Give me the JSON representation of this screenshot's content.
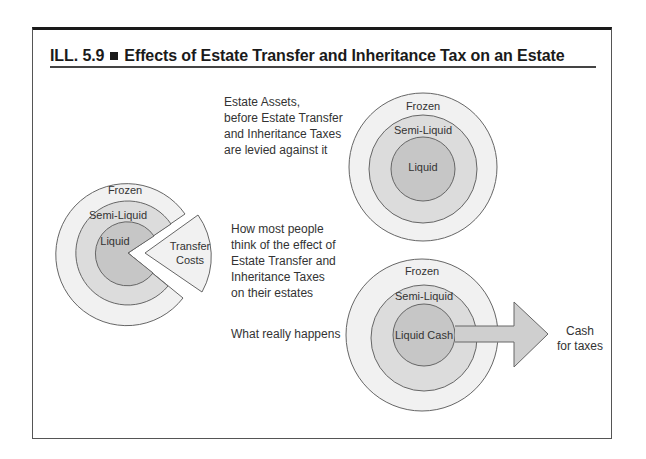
{
  "figure": {
    "label": "ILL. 5.9",
    "title": "Effects of Estate Transfer and Inheritance Tax on an Estate"
  },
  "captions": {
    "before": [
      "Estate Assets,",
      "before Estate Transfer",
      "and Inheritance Taxes",
      "are levied against it"
    ],
    "perceived": [
      "How most people",
      "think of the effect of",
      "Estate Transfer and",
      "Inheritance Taxes",
      "on their estates"
    ],
    "actual": [
      "What really happens"
    ]
  },
  "diagrams": {
    "before": {
      "outer": "Frozen",
      "middle": "Semi-Liquid",
      "inner": "Liquid"
    },
    "perceived": {
      "outer": "Frozen",
      "middle": "Semi-Liquid",
      "inner": "Liquid",
      "wedge": [
        "Transfer",
        "Costs"
      ]
    },
    "actual": {
      "outer": "Frozen",
      "middle": "Semi-Liquid",
      "inner": "Liquid Cash",
      "arrow_label": [
        "Cash",
        "for taxes"
      ]
    }
  },
  "colors": {
    "outer_fill": "#f1f1f1",
    "middle_fill": "#dcdcdc",
    "inner_fill": "#c6c6c6",
    "stroke": "#666666"
  }
}
